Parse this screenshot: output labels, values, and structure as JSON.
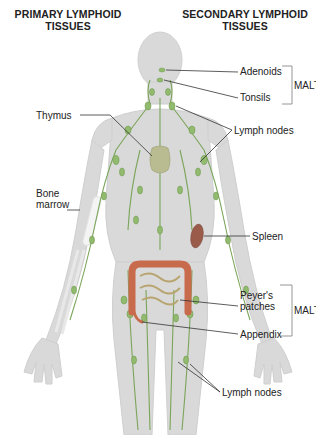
{
  "headers": {
    "primary": [
      "PRIMARY LYMPHOID",
      "TISSUES"
    ],
    "secondary": [
      "SECONDARY LYMPHOID",
      "TISSUES"
    ]
  },
  "labels": {
    "thymus": "Thymus",
    "bone_marrow": [
      "Bone",
      "marrow"
    ],
    "adenoids": "Adenoids",
    "tonsils": "Tonsils",
    "malt_upper": "MALT",
    "lymph_nodes_upper": "Lymph nodes",
    "spleen": "Spleen",
    "peyers_patches": [
      "Peyer's",
      "patches"
    ],
    "malt_lower": "MALT",
    "appendix": "Appendix",
    "lymph_nodes_lower": "Lymph nodes"
  },
  "colors": {
    "body_fill": "#d9d9d9",
    "body_stroke": "#c4c4c4",
    "lymph_vessel": "#6b9a4a",
    "lymph_node": "#8fb86b",
    "thymus": "#b5b88a",
    "spleen": "#9a5a4a",
    "intestine": "#c96a4a",
    "small_intestine": "#b8a870",
    "bone": "#f2f2f2",
    "leader_line": "#333333",
    "bracket": "#888888"
  }
}
